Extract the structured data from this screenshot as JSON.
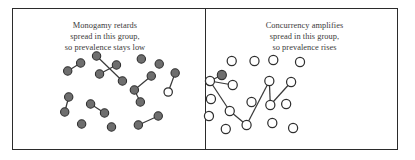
{
  "figure": {
    "background_color": "#ffffff",
    "frame_color": "#2b2b2b",
    "node_filled_color": "#6e6e6e",
    "node_hollow_color": "#ffffff",
    "node_stroke_color": "#2f2f2f",
    "edge_color": "#3a3a3a",
    "caption_color": "#3a3a3a"
  },
  "panels": [
    {
      "id": "left",
      "caption_lines": [
        "Monogamy retards",
        "spread in this group,",
        "so prevalence stays low"
      ],
      "graph": {
        "node_radius": 4.2,
        "nodes": [
          {
            "id": "L1",
            "x": 55,
            "y": 62,
            "state": "filled"
          },
          {
            "id": "L2",
            "x": 68,
            "y": 54,
            "state": "filled"
          },
          {
            "id": "L3",
            "x": 84,
            "y": 47,
            "state": "filled"
          },
          {
            "id": "L4",
            "x": 104,
            "y": 56,
            "state": "filled"
          },
          {
            "id": "L5",
            "x": 129,
            "y": 50,
            "state": "filled"
          },
          {
            "id": "L6",
            "x": 147,
            "y": 55,
            "state": "filled"
          },
          {
            "id": "L7",
            "x": 87,
            "y": 65,
            "state": "filled"
          },
          {
            "id": "L8",
            "x": 110,
            "y": 72,
            "state": "filled"
          },
          {
            "id": "L9",
            "x": 139,
            "y": 67,
            "state": "filled"
          },
          {
            "id": "L10",
            "x": 163,
            "y": 64,
            "state": "filled"
          },
          {
            "id": "L11",
            "x": 122,
            "y": 81,
            "state": "filled"
          },
          {
            "id": "L12",
            "x": 128,
            "y": 93,
            "state": "filled"
          },
          {
            "id": "L13",
            "x": 156,
            "y": 83,
            "state": "hollow"
          },
          {
            "id": "L14",
            "x": 56,
            "y": 88,
            "state": "filled"
          },
          {
            "id": "L15",
            "x": 52,
            "y": 103,
            "state": "filled"
          },
          {
            "id": "L16",
            "x": 78,
            "y": 95,
            "state": "filled"
          },
          {
            "id": "L17",
            "x": 92,
            "y": 104,
            "state": "filled"
          },
          {
            "id": "L18",
            "x": 69,
            "y": 115,
            "state": "filled"
          },
          {
            "id": "L19",
            "x": 99,
            "y": 118,
            "state": "filled"
          },
          {
            "id": "L20",
            "x": 126,
            "y": 116,
            "state": "filled"
          },
          {
            "id": "L21",
            "x": 146,
            "y": 107,
            "state": "filled"
          }
        ],
        "edges": [
          {
            "source": "L1",
            "target": "L2"
          },
          {
            "source": "L3",
            "target": "L8"
          },
          {
            "source": "L7",
            "target": "L4"
          },
          {
            "source": "L9",
            "target": "L11"
          },
          {
            "source": "L11",
            "target": "L12"
          },
          {
            "source": "L10",
            "target": "L13"
          },
          {
            "source": "L14",
            "target": "L15"
          },
          {
            "source": "L16",
            "target": "L17"
          },
          {
            "source": "L20",
            "target": "L21"
          }
        ]
      }
    },
    {
      "id": "right",
      "caption_lines": [
        "Concurrency amplifies",
        "spread in this group,",
        "so prevalence rises"
      ],
      "graph": {
        "node_radius": 4.6,
        "nodes": [
          {
            "id": "R1",
            "x": 26,
            "y": 52,
            "state": "hollow"
          },
          {
            "id": "R2",
            "x": 16,
            "y": 66,
            "state": "filled"
          },
          {
            "id": "R3",
            "x": 4,
            "y": 72,
            "state": "hollow"
          },
          {
            "id": "R4",
            "x": 27,
            "y": 76,
            "state": "hollow"
          },
          {
            "id": "R5",
            "x": 49,
            "y": 52,
            "state": "hollow"
          },
          {
            "id": "R6",
            "x": 68,
            "y": 51,
            "state": "hollow"
          },
          {
            "id": "R7",
            "x": 64,
            "y": 72,
            "state": "hollow"
          },
          {
            "id": "R8",
            "x": 86,
            "y": 73,
            "state": "hollow"
          },
          {
            "id": "R9",
            "x": 5,
            "y": 90,
            "state": "hollow"
          },
          {
            "id": "R10",
            "x": 3,
            "y": 107,
            "state": "hollow"
          },
          {
            "id": "R11",
            "x": 24,
            "y": 102,
            "state": "hollow"
          },
          {
            "id": "R12",
            "x": 20,
            "y": 120,
            "state": "hollow"
          },
          {
            "id": "R13",
            "x": 41,
            "y": 116,
            "state": "hollow"
          },
          {
            "id": "R14",
            "x": 46,
            "y": 93,
            "state": "hollow"
          },
          {
            "id": "R15",
            "x": 65,
            "y": 96,
            "state": "hollow"
          },
          {
            "id": "R16",
            "x": 67,
            "y": 114,
            "state": "hollow"
          },
          {
            "id": "R17",
            "x": 81,
            "y": 95,
            "state": "hollow"
          },
          {
            "id": "R18",
            "x": 88,
            "y": 119,
            "state": "hollow"
          },
          {
            "id": "R19",
            "x": 95,
            "y": 53,
            "state": "hollow"
          }
        ],
        "edges": [
          {
            "source": "R2",
            "target": "R3"
          },
          {
            "source": "R3",
            "target": "R4"
          },
          {
            "source": "R3",
            "target": "R11"
          },
          {
            "source": "R11",
            "target": "R13"
          },
          {
            "source": "R13",
            "target": "R7"
          },
          {
            "source": "R7",
            "target": "R15"
          },
          {
            "source": "R15",
            "target": "R8"
          }
        ]
      }
    }
  ]
}
